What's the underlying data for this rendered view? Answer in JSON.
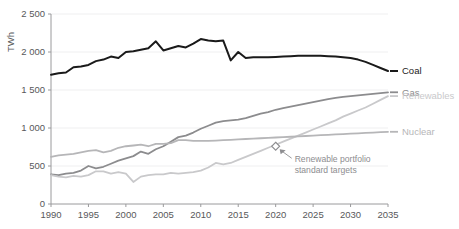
{
  "chart_data": {
    "type": "line",
    "title": "",
    "xlabel": "",
    "ylabel": "TWh",
    "xlim": [
      1990,
      2035
    ],
    "ylim": [
      0,
      2500
    ],
    "ytick_labels": [
      "2 500",
      "2 000",
      "1 500",
      "1 000",
      "500",
      "0"
    ],
    "ytick_values": [
      2500,
      2000,
      1500,
      1000,
      500,
      0
    ],
    "xtick_labels": [
      "1990",
      "1995",
      "2000",
      "2005",
      "2010",
      "2015",
      "2020",
      "2025",
      "2030",
      "2035"
    ],
    "xtick_values": [
      1990,
      1995,
      2000,
      2005,
      2010,
      2015,
      2020,
      2025,
      2030,
      2035
    ],
    "grid": "horizontal",
    "legend_position": "right-of-plot-end-labels",
    "x": [
      1990,
      1991,
      1992,
      1993,
      1994,
      1995,
      1996,
      1997,
      1998,
      1999,
      2000,
      2001,
      2002,
      2003,
      2004,
      2005,
      2006,
      2007,
      2008,
      2009,
      2010,
      2011,
      2012,
      2013,
      2014,
      2015,
      2016,
      2017,
      2018,
      2019,
      2020,
      2021,
      2022,
      2023,
      2024,
      2025,
      2026,
      2027,
      2028,
      2029,
      2030,
      2031,
      2032,
      2033,
      2034,
      2035
    ],
    "series": [
      {
        "name": "Coal",
        "color": "#1a1a1a",
        "width": 2.0,
        "values": [
          1700,
          1720,
          1730,
          1800,
          1810,
          1830,
          1880,
          1900,
          1940,
          1920,
          2000,
          2010,
          2030,
          2050,
          2140,
          2020,
          2050,
          2080,
          2060,
          2110,
          2170,
          2150,
          2140,
          2150,
          1890,
          2000,
          1920,
          1930,
          1930,
          1930,
          1935,
          1940,
          1945,
          1950,
          1950,
          1950,
          1950,
          1945,
          1940,
          1930,
          1920,
          1900,
          1870,
          1830,
          1790,
          1750
        ]
      },
      {
        "name": "Gas",
        "color": "#8c8c8e",
        "width": 1.8,
        "values": [
          390,
          380,
          400,
          410,
          440,
          500,
          470,
          490,
          530,
          570,
          600,
          630,
          690,
          660,
          720,
          760,
          820,
          880,
          900,
          940,
          990,
          1030,
          1070,
          1090,
          1100,
          1110,
          1130,
          1160,
          1190,
          1210,
          1240,
          1260,
          1280,
          1300,
          1320,
          1340,
          1360,
          1380,
          1395,
          1410,
          1420,
          1430,
          1440,
          1450,
          1460,
          1470
        ]
      },
      {
        "name": "Renewables",
        "color": "#c9c9cb",
        "width": 1.8,
        "values": [
          380,
          360,
          350,
          370,
          360,
          380,
          430,
          430,
          400,
          420,
          400,
          290,
          360,
          380,
          390,
          390,
          410,
          400,
          410,
          420,
          440,
          480,
          540,
          520,
          540,
          580,
          620,
          660,
          700,
          740,
          780,
          820,
          860,
          900,
          940,
          980,
          1020,
          1060,
          1100,
          1150,
          1190,
          1230,
          1270,
          1320,
          1370,
          1420
        ]
      },
      {
        "name": "Nuclear",
        "color": "#b6b6b8",
        "width": 1.8,
        "values": [
          620,
          640,
          650,
          660,
          680,
          700,
          710,
          680,
          700,
          740,
          760,
          770,
          780,
          760,
          790,
          790,
          800,
          840,
          840,
          830,
          830,
          830,
          835,
          840,
          845,
          850,
          855,
          860,
          865,
          870,
          875,
          880,
          885,
          890,
          895,
          900,
          905,
          910,
          915,
          920,
          925,
          930,
          935,
          940,
          945,
          950
        ]
      }
    ],
    "annotations": [
      {
        "text_line1": "Renewable portfolio",
        "text_line2": "standard targets",
        "marker": "diamond",
        "marker_x": 2020,
        "marker_y": 760,
        "color": "#8d8d90"
      }
    ]
  },
  "axis": {
    "y_title": "TWh"
  }
}
